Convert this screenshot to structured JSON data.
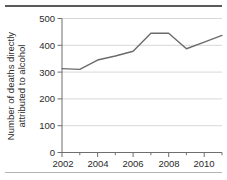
{
  "chart_data": {
    "type": "line",
    "title": "",
    "subtitle": "",
    "xlabel": "",
    "ylabel_line1": "Number of deaths directly",
    "ylabel_line2": "attributed to alcohol",
    "ylabel": "Number of deaths directly attributed to alcohol",
    "x": [
      2002,
      2003,
      2004,
      2005,
      2006,
      2007,
      2008,
      2009,
      2010,
      2011
    ],
    "values": [
      313,
      310,
      345,
      360,
      378,
      445,
      445,
      387,
      412,
      437
    ],
    "series": [
      {
        "name": "Deaths directly attributed to alcohol",
        "values": [
          313,
          310,
          345,
          360,
          378,
          445,
          445,
          387,
          412,
          437
        ]
      }
    ],
    "xlim": [
      2002,
      2011.4
    ],
    "ylim": [
      0,
      500
    ],
    "yticks": [
      0,
      100,
      200,
      300,
      400,
      500
    ],
    "ytick_labels": [
      "0",
      "100",
      "200",
      "300",
      "400",
      "500"
    ],
    "xticks": [
      2002,
      2003,
      2004,
      2005,
      2006,
      2007,
      2008,
      2009,
      2010,
      2011
    ],
    "xtick_labels_major": [
      "2002",
      "2004",
      "2006",
      "2008",
      "2010"
    ],
    "xticks_major": [
      2002,
      2004,
      2006,
      2008,
      2010
    ],
    "grid": "horizontal",
    "legend": "none",
    "colors": {
      "line": "#6b6b6b",
      "grid": "#d8d8d8",
      "axis": "#6e6e6e",
      "text": "#2a2a2a",
      "background": "#ffffff",
      "rule_top": "#5a5a5a",
      "rule_bottom": "#b4b4b4"
    }
  }
}
